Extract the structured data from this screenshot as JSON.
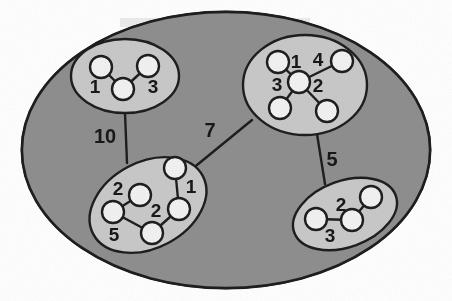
{
  "diagram": {
    "colors": {
      "page_background": "#ffffff",
      "outer_ellipse_fill": "#8f8f8f",
      "outer_ellipse_stroke": "#1d1e20",
      "cluster_fill": "#c9c9c9",
      "cluster_stroke": "#1d1e20",
      "node_fill": "#f2f2f2",
      "node_stroke": "#1d1e20",
      "edge_stroke": "#1d1e20",
      "label_color": "#17181a"
    },
    "outer_ellipse": {
      "cx": 226,
      "cy": 150,
      "rx": 204,
      "ry": 138
    },
    "clusters": [
      {
        "id": "cluster-top-left",
        "name": "top-left-cluster",
        "ellipse": {
          "cx": 125,
          "cy": 76,
          "rx": 54,
          "ry": 37,
          "rotate": 0
        },
        "nodes": [
          {
            "id": "tl-n1",
            "cx": 101,
            "cy": 67,
            "r": 11
          },
          {
            "id": "tl-n2",
            "cx": 148,
            "cy": 66,
            "r": 11
          },
          {
            "id": "tl-n3",
            "cx": 123,
            "cy": 89,
            "r": 11
          }
        ],
        "edges": [
          {
            "from": "tl-n1",
            "to": "tl-n3",
            "weight": "1",
            "label_x": 95,
            "label_y": 93
          },
          {
            "from": "tl-n2",
            "to": "tl-n3",
            "weight": "3",
            "label_x": 142,
            "label_y": 93
          }
        ]
      },
      {
        "id": "cluster-top-right",
        "name": "top-right-cluster",
        "ellipse": {
          "cx": 305,
          "cy": 85,
          "rx": 62,
          "ry": 50,
          "rotate": 0
        },
        "nodes": [
          {
            "id": "tr-c",
            "cx": 299,
            "cy": 82,
            "r": 11
          },
          {
            "id": "tr-n1",
            "cx": 278,
            "cy": 62,
            "r": 11
          },
          {
            "id": "tr-n2",
            "cx": 342,
            "cy": 61,
            "r": 11
          },
          {
            "id": "tr-n3",
            "cx": 280,
            "cy": 108,
            "r": 11
          },
          {
            "id": "tr-n4",
            "cx": 327,
            "cy": 111,
            "r": 11
          }
        ],
        "edges": [
          {
            "from": "tr-c",
            "to": "tr-n1",
            "weight": "1",
            "label_x": 293,
            "label_y": 66
          },
          {
            "from": "tr-c",
            "to": "tr-n2",
            "weight": "4",
            "label_x": 315,
            "label_y": 64
          },
          {
            "from": "tr-c",
            "to": "tr-n3",
            "weight": "3",
            "label_x": 272,
            "label_y": 91
          },
          {
            "from": "tr-c",
            "to": "tr-n4",
            "weight": "2",
            "label_x": 312,
            "label_y": 92
          }
        ]
      },
      {
        "id": "cluster-bottom-left",
        "name": "bottom-left-cluster",
        "ellipse": {
          "cx": 148,
          "cy": 205,
          "rx": 62,
          "ry": 43,
          "rotate": -28
        },
        "nodes": [
          {
            "id": "bl-n1",
            "cx": 175,
            "cy": 168,
            "r": 11
          },
          {
            "id": "bl-n2",
            "cx": 179,
            "cy": 209,
            "r": 11
          },
          {
            "id": "bl-n3",
            "cx": 152,
            "cy": 233,
            "r": 11
          },
          {
            "id": "bl-n4",
            "cx": 113,
            "cy": 212,
            "r": 11
          },
          {
            "id": "bl-n5",
            "cx": 140,
            "cy": 195,
            "r": 11
          }
        ],
        "edges": [
          {
            "from": "bl-n1",
            "to": "bl-n2",
            "weight": "1",
            "label_x": 190,
            "label_y": 190
          },
          {
            "from": "bl-n2",
            "to": "bl-n3",
            "weight": "2",
            "label_x": 153,
            "label_y": 212
          },
          {
            "from": "bl-n3",
            "to": "bl-n4",
            "weight": "5",
            "label_x": 113,
            "label_y": 239
          },
          {
            "from": "bl-n4",
            "to": "bl-n5",
            "weight": "2",
            "label_x": 117,
            "label_y": 192
          }
        ]
      },
      {
        "id": "cluster-bottom-right",
        "name": "bottom-right-cluster",
        "ellipse": {
          "cx": 345,
          "cy": 214,
          "rx": 54,
          "ry": 33,
          "rotate": -20
        },
        "nodes": [
          {
            "id": "br-n1",
            "cx": 316,
            "cy": 219,
            "r": 11
          },
          {
            "id": "br-n2",
            "cx": 352,
            "cy": 220,
            "r": 11
          },
          {
            "id": "br-n3",
            "cx": 371,
            "cy": 197,
            "r": 11
          }
        ],
        "edges": [
          {
            "from": "br-n1",
            "to": "br-n2",
            "weight": "3",
            "label_x": 327,
            "label_y": 240
          },
          {
            "from": "br-n2",
            "to": "br-n3",
            "weight": "2",
            "label_x": 341,
            "label_y": 208
          }
        ]
      }
    ],
    "cluster_edges": [
      {
        "id": "edge-tl-bl",
        "name": "edge-top-left-to-bottom-left",
        "x1": 125,
        "y1": 113,
        "x2": 127,
        "y2": 163,
        "weight": "10",
        "label_x": 98,
        "label_y": 143
      },
      {
        "id": "edge-bl-tr",
        "name": "edge-bottom-left-to-top-right",
        "x1": 186,
        "y1": 174,
        "x2": 252,
        "y2": 120,
        "weight": "7",
        "label_x": 207,
        "label_y": 137
      },
      {
        "id": "edge-tr-br",
        "name": "edge-top-right-to-bottom-right",
        "x1": 317,
        "y1": 134,
        "x2": 325,
        "y2": 184,
        "weight": "5",
        "label_x": 330,
        "label_y": 164
      }
    ]
  }
}
